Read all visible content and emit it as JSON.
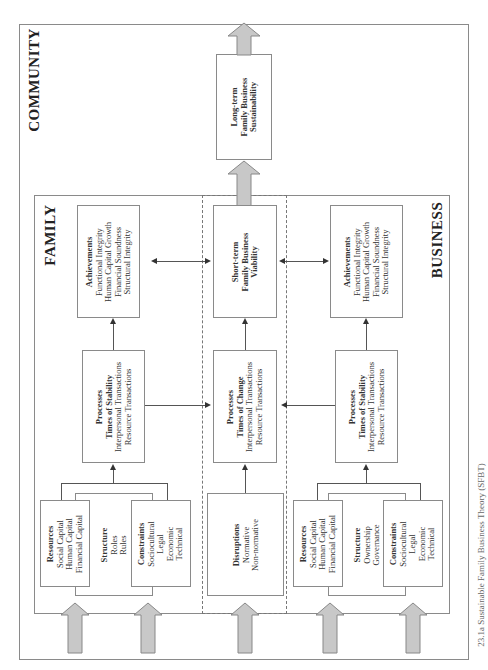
{
  "regions": {
    "community": "COMMUNITY",
    "family": "FAMILY",
    "business": "BUSINESS"
  },
  "long_term": {
    "lines": [
      "Long-term",
      "Family Business",
      "Sustainability"
    ]
  },
  "short_term": {
    "lines": [
      "Short-term",
      "Family Business",
      "Viability"
    ]
  },
  "family": {
    "achievements": {
      "title": "Achievements",
      "items": [
        "Functional Integrity",
        "Human Capital Growth",
        "Financial Soundness",
        "Structural Integrity"
      ]
    },
    "processes": {
      "title": "Processes",
      "subtitle": "Times of Stability",
      "items": [
        "Interpersonal Transactions",
        "Resource Transactions"
      ]
    },
    "resources": {
      "title": "Resources",
      "items": [
        "Social Capital",
        "Human Capital",
        "Financial Capital"
      ]
    },
    "structure": {
      "title": "Structure",
      "items": [
        "Roles",
        "Rules"
      ]
    },
    "constraints": {
      "title": "Constraints",
      "items": [
        "Sociocultural",
        "Legal",
        "Economic",
        "Technical"
      ]
    }
  },
  "center": {
    "processes": {
      "title": "Processes",
      "subtitle": "Times of Change",
      "items": [
        "Interpersonal Transactions",
        "Resource Transactions"
      ]
    },
    "disruptions": {
      "title": "Disruptions",
      "items": [
        "Normative",
        "Non-normative"
      ]
    }
  },
  "business": {
    "achievements": {
      "title": "Achievements",
      "items": [
        "Functional Integrity",
        "Human Capital Growth",
        "Financial Soundness",
        "Structural Integrity"
      ]
    },
    "processes": {
      "title": "Processes",
      "subtitle": "Times of Stability",
      "items": [
        "Interpersonal Transactions",
        "Resource Transactions"
      ]
    },
    "resources": {
      "title": "Resources",
      "items": [
        "Social Capital",
        "Human Capital",
        "Financial Capital"
      ]
    },
    "structure": {
      "title": "Structure",
      "items": [
        "Ownership",
        "Governance"
      ]
    },
    "constraints": {
      "title": "Constraints",
      "items": [
        "Sociocultural",
        "Legal",
        "Economic",
        "Technical"
      ]
    }
  },
  "caption": "23.1a Sustainable Family Business Theory (SFBT)",
  "colors": {
    "arrow_fill": "#c8c8c8",
    "arrow_stroke": "#888888",
    "border": "#8a8a8a"
  }
}
